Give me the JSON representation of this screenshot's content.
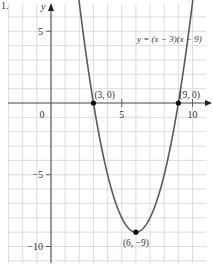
{
  "figure": {
    "label": "1.",
    "equation": "y = (x − 3)(x − 9)"
  },
  "chart_data": {
    "type": "line",
    "title": "",
    "function": "y = (x - 3)(x - 9)",
    "xlabel": "x",
    "ylabel": "y",
    "xlim": [
      -3.5,
      11.5
    ],
    "ylim": [
      -11.5,
      7
    ],
    "grid": true,
    "x_ticks": [
      0,
      5,
      10
    ],
    "x_tick_labels": [
      "0",
      "5",
      "10"
    ],
    "y_ticks": [
      5,
      -5,
      -10
    ],
    "y_tick_labels": [
      "5",
      "−5",
      "−10"
    ],
    "series": [
      {
        "name": "y = (x − 3)(x − 9)",
        "x": [
          1.4,
          2,
          3,
          4,
          5,
          6,
          7,
          8,
          9,
          10,
          10.6
        ],
        "y": [
          12.16,
          7,
          0,
          -5,
          -8,
          -9,
          -8,
          -5,
          0,
          7,
          12.16
        ],
        "color": "#555555"
      }
    ],
    "points": [
      {
        "x": 3,
        "y": 0,
        "label": "(3, 0)"
      },
      {
        "x": 9,
        "y": 0,
        "label": "(9, 0)"
      },
      {
        "x": 6,
        "y": -9,
        "label": "(6, −9)"
      }
    ],
    "annotations": [
      {
        "text": "y = (x − 3)(x − 9)",
        "x": 8,
        "y": 4.5
      }
    ]
  },
  "colors": {
    "grid": "#d4d4d4",
    "axis": "#555555",
    "curve": "#5a5a5a",
    "point": "#111111"
  }
}
